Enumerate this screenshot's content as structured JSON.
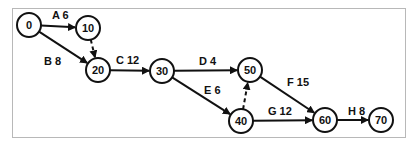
{
  "diagram": {
    "type": "activity-on-arrow network",
    "nodes": [
      {
        "id": "0",
        "label": "0",
        "x": 29,
        "y": 25
      },
      {
        "id": "10",
        "label": "10",
        "x": 88,
        "y": 28
      },
      {
        "id": "20",
        "label": "20",
        "x": 98,
        "y": 70
      },
      {
        "id": "30",
        "label": "30",
        "x": 162,
        "y": 71
      },
      {
        "id": "50",
        "label": "50",
        "x": 250,
        "y": 70
      },
      {
        "id": "40",
        "label": "40",
        "x": 241,
        "y": 121
      },
      {
        "id": "60",
        "label": "60",
        "x": 325,
        "y": 120
      },
      {
        "id": "70",
        "label": "70",
        "x": 381,
        "y": 120
      }
    ],
    "edges": [
      {
        "from": "0",
        "to": "10",
        "label": "A 6",
        "dashed": false,
        "lx": 52,
        "ly": 19
      },
      {
        "from": "0",
        "to": "20",
        "label": "B 8",
        "dashed": false,
        "lx": 44,
        "ly": 65
      },
      {
        "from": "10",
        "to": "20",
        "label": "",
        "dashed": true
      },
      {
        "from": "20",
        "to": "30",
        "label": "C 12",
        "dashed": false,
        "lx": 116,
        "ly": 64
      },
      {
        "from": "30",
        "to": "50",
        "label": "D 4",
        "dashed": false,
        "lx": 199,
        "ly": 65
      },
      {
        "from": "30",
        "to": "40",
        "label": "E 6",
        "dashed": false,
        "lx": 204,
        "ly": 94
      },
      {
        "from": "40",
        "to": "50",
        "label": "",
        "dashed": true
      },
      {
        "from": "50",
        "to": "60",
        "label": "F 15",
        "dashed": false,
        "lx": 287,
        "ly": 86
      },
      {
        "from": "40",
        "to": "60",
        "label": "G 12",
        "dashed": false,
        "lx": 268,
        "ly": 115
      },
      {
        "from": "60",
        "to": "70",
        "label": "H 8",
        "dashed": false,
        "lx": 348,
        "ly": 115
      }
    ],
    "colors": {
      "stroke": "#111111",
      "frame": "#b8b8b8",
      "background": "#ffffff"
    }
  }
}
